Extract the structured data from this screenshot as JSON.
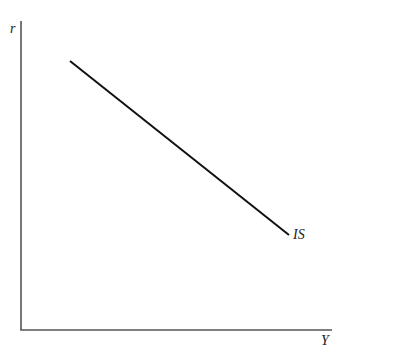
{
  "diagram": {
    "title": "",
    "axes": {
      "y_label": "r",
      "x_label": "Y"
    },
    "curves": [
      {
        "name": "IS",
        "label": "IS",
        "shape": "downward-sloping line",
        "color": "#111111"
      }
    ],
    "colors": {
      "axis": "#555555",
      "curve": "#111111",
      "background": "#ffffff"
    }
  }
}
